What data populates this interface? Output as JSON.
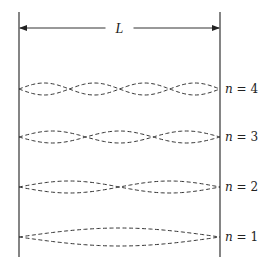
{
  "diagram": {
    "type": "standing-waves-in-box",
    "length_label": "L",
    "walls": {
      "left_x": 19,
      "right_x": 220,
      "top_y": 12,
      "bottom_y": 257
    },
    "arrow_y": 28,
    "wave_color": "#333333",
    "line_color": "#333333",
    "modes": [
      {
        "n": 4,
        "label_var": "n",
        "label_eq": " = ",
        "label_val": "4",
        "center_y": 89,
        "amplitude": 6
      },
      {
        "n": 3,
        "label_var": "n",
        "label_eq": " = ",
        "label_val": "3",
        "center_y": 137,
        "amplitude": 6
      },
      {
        "n": 2,
        "label_var": "n",
        "label_eq": " = ",
        "label_val": "2",
        "center_y": 187,
        "amplitude": 6
      },
      {
        "n": 1,
        "label_var": "n",
        "label_eq": " = ",
        "label_val": "1",
        "center_y": 237,
        "amplitude": 9
      }
    ]
  }
}
